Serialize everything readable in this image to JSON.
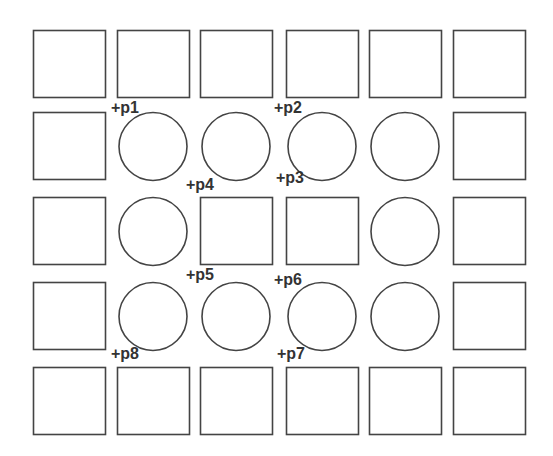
{
  "diagram": {
    "stroke_color": "#444444",
    "background": "#ffffff",
    "columns_x": [
      33,
      117,
      200,
      286,
      369,
      453
    ],
    "rows_y": [
      30,
      112,
      197,
      282,
      367
    ],
    "cell_width": 72,
    "cell_height": 67,
    "grid": [
      [
        "square",
        "square",
        "square",
        "square",
        "square",
        "square"
      ],
      [
        "square",
        "circle",
        "circle",
        "circle",
        "circle",
        "square"
      ],
      [
        "square",
        "circle",
        "square",
        "square",
        "circle",
        "square"
      ],
      [
        "square",
        "circle",
        "circle",
        "circle",
        "circle",
        "square"
      ],
      [
        "square",
        "square",
        "square",
        "square",
        "square",
        "square"
      ]
    ],
    "circle_radius": 34
  },
  "labels": [
    {
      "text": "+p1",
      "x": 111,
      "y": 100
    },
    {
      "text": "+p2",
      "x": 274,
      "y": 100
    },
    {
      "text": "+p4",
      "x": 186,
      "y": 177
    },
    {
      "text": "+p3",
      "x": 276,
      "y": 170
    },
    {
      "text": "+p5",
      "x": 186,
      "y": 267
    },
    {
      "text": "+p6",
      "x": 274,
      "y": 272
    },
    {
      "text": "+p8",
      "x": 111,
      "y": 346
    },
    {
      "text": "+p7",
      "x": 277,
      "y": 346
    }
  ]
}
